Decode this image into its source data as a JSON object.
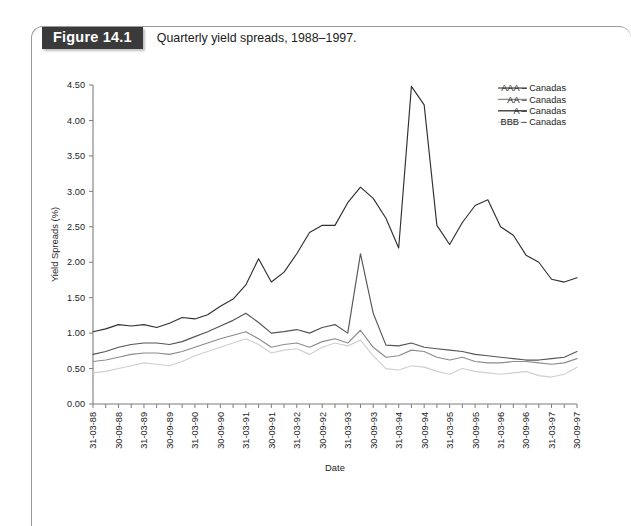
{
  "figure": {
    "tag": "Figure 14.1",
    "caption": "Quarterly yield spreads, 1988–1997."
  },
  "chart_data": {
    "type": "line",
    "title": "",
    "xlabel": "Date",
    "ylabel": "Yield Spreads (%)",
    "ylim": [
      0.0,
      4.5
    ],
    "yticks": [
      "0.00",
      "0.50",
      "1.00",
      "1.50",
      "2.00",
      "2.50",
      "3.00",
      "3.50",
      "4.00",
      "4.50"
    ],
    "ytick_values": [
      0.0,
      0.5,
      1.0,
      1.5,
      2.0,
      2.5,
      3.0,
      3.5,
      4.0,
      4.5
    ],
    "grid": false,
    "legend_position": "top-right",
    "x_tick_frequency": "quarterly",
    "x_label_frequency": "semi-annual",
    "x": [
      "31-03-88",
      "30-06-88",
      "30-09-88",
      "31-12-88",
      "31-03-89",
      "30-06-89",
      "30-09-89",
      "31-12-89",
      "31-03-90",
      "30-06-90",
      "30-09-90",
      "31-12-90",
      "31-03-91",
      "30-06-91",
      "30-09-91",
      "31-12-91",
      "31-03-92",
      "30-06-92",
      "30-09-92",
      "31-12-92",
      "31-03-93",
      "30-06-93",
      "30-09-93",
      "31-12-93",
      "31-03-94",
      "30-06-94",
      "30-09-94",
      "31-12-94",
      "31-03-95",
      "30-06-95",
      "30-09-95",
      "31-12-95",
      "31-03-96",
      "30-06-96",
      "30-09-96",
      "31-12-96",
      "31-03-97",
      "30-06-97",
      "30-09-97"
    ],
    "xtick_labels": [
      "31-03-88",
      "30-09-88",
      "31-03-89",
      "30-09-89",
      "31-03-90",
      "30-09-90",
      "31-03-91",
      "30-09-91",
      "31-03-92",
      "30-09-92",
      "31-03-93",
      "30-09-93",
      "31-03-94",
      "30-09-94",
      "31-03-95",
      "30-09-95",
      "31-03-96",
      "30-09-96",
      "31-03-97",
      "30-09-97"
    ],
    "series": [
      {
        "name": "AAA – Canadas",
        "color": "#555555",
        "values": [
          0.7,
          0.74,
          0.8,
          0.84,
          0.86,
          0.86,
          0.84,
          0.88,
          0.95,
          1.02,
          1.1,
          1.18,
          1.28,
          1.15,
          1.0,
          1.02,
          1.05,
          1.0,
          1.08,
          1.12,
          1.0,
          2.12,
          1.28,
          0.83,
          0.82,
          0.86,
          0.8,
          0.78,
          0.76,
          0.74,
          0.7,
          0.68,
          0.66,
          0.64,
          0.62,
          0.62,
          0.64,
          0.66,
          0.74
        ]
      },
      {
        "name": "AA – Canadas",
        "color": "#8c8c8c",
        "values": [
          0.6,
          0.62,
          0.66,
          0.7,
          0.72,
          0.72,
          0.7,
          0.74,
          0.8,
          0.86,
          0.92,
          0.97,
          1.02,
          0.92,
          0.8,
          0.84,
          0.86,
          0.8,
          0.88,
          0.92,
          0.86,
          1.04,
          0.8,
          0.66,
          0.68,
          0.76,
          0.74,
          0.66,
          0.62,
          0.66,
          0.6,
          0.58,
          0.58,
          0.6,
          0.6,
          0.58,
          0.56,
          0.58,
          0.64
        ]
      },
      {
        "name": "A – Canadas",
        "color": "#303030",
        "values": [
          1.02,
          1.06,
          1.12,
          1.1,
          1.12,
          1.08,
          1.14,
          1.22,
          1.2,
          1.26,
          1.38,
          1.48,
          1.68,
          2.05,
          1.72,
          1.86,
          2.12,
          2.42,
          2.52,
          2.52,
          2.84,
          3.06,
          2.9,
          2.62,
          2.2,
          4.48,
          4.22,
          2.52,
          2.25,
          2.56,
          2.8,
          2.88,
          2.5,
          2.38,
          2.1,
          2.0,
          1.76,
          1.72,
          1.78
        ]
      },
      {
        "name": "BBB – Canadas",
        "color": "#cfcfcf",
        "values": [
          0.44,
          0.46,
          0.5,
          0.54,
          0.58,
          0.56,
          0.54,
          0.6,
          0.68,
          0.74,
          0.8,
          0.86,
          0.92,
          0.84,
          0.72,
          0.76,
          0.78,
          0.7,
          0.8,
          0.86,
          0.82,
          0.9,
          0.68,
          0.5,
          0.48,
          0.54,
          0.52,
          0.46,
          0.42,
          0.5,
          0.46,
          0.44,
          0.42,
          0.44,
          0.46,
          0.4,
          0.38,
          0.42,
          0.52
        ]
      }
    ]
  }
}
